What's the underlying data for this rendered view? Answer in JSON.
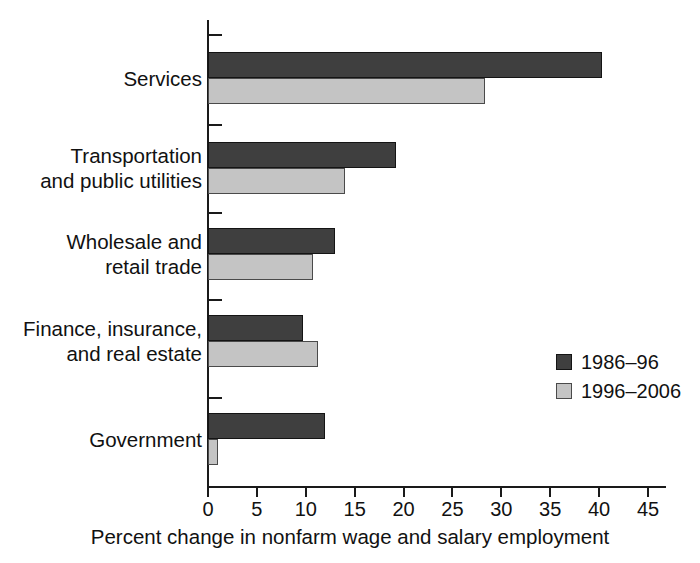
{
  "chart_data": {
    "type": "bar",
    "orientation": "horizontal",
    "title": "",
    "subtitle": "",
    "xlabel": "Percent change in nonfarm wage and salary employment",
    "ylabel": "",
    "xlim": [
      0,
      45
    ],
    "xticks": [
      0,
      5,
      10,
      15,
      20,
      25,
      30,
      35,
      40,
      45
    ],
    "xtick_labels": [
      "0",
      "5",
      "10",
      "15",
      "20",
      "25",
      "30",
      "35",
      "40",
      "45"
    ],
    "grid": false,
    "legend_position": "right-middle",
    "categories": [
      "Services",
      "Transportation and public utilities",
      "Wholesale and retail trade",
      "Finance, insurance, and real estate",
      "Government"
    ],
    "category_label_lines": [
      [
        "Services"
      ],
      [
        "Transportation",
        "and public utilities"
      ],
      [
        "Wholesale and",
        "retail trade"
      ],
      [
        "Finance, insurance,",
        "and real estate"
      ],
      [
        "Government"
      ]
    ],
    "series": [
      {
        "name": "1986–96",
        "color": "#3f3f3f",
        "values": [
          40.3,
          19.2,
          13.0,
          9.7,
          12.0
        ]
      },
      {
        "name": "1996–2006",
        "color": "#c4c4c4",
        "values": [
          28.3,
          14.0,
          10.7,
          11.2,
          1.0
        ]
      }
    ]
  },
  "legend": {
    "entries": [
      {
        "label": "1986–96",
        "color": "#3f3f3f"
      },
      {
        "label": "1996–2006",
        "color": "#c4c4c4"
      }
    ]
  },
  "colors": {
    "series_1": "#3f3f3f",
    "series_2": "#c4c4c4",
    "axis": "#1a1a1a",
    "text": "#111111",
    "background": "#ffffff"
  }
}
